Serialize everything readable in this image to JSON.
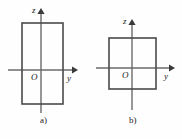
{
  "figure": {
    "background_color": "#fefefe",
    "line_color": "#555555",
    "box_color": "#4a4a4a",
    "text_color": "#1a1a1a",
    "panels": [
      {
        "id": "a",
        "caption": "a)",
        "origin_label": "O",
        "vertical_axis_label": "z",
        "horizontal_axis_label": "y",
        "shape": "tall-rectangle",
        "rect": {
          "x": 22,
          "y": 23,
          "width": 41,
          "height": 81
        },
        "origin": {
          "x": 41,
          "y": 70
        },
        "vertical_axis": {
          "x": 41,
          "y_top": 10,
          "y_bottom": 113
        },
        "horizontal_axis": {
          "y": 70,
          "x_left": 8,
          "x_right": 75
        }
      },
      {
        "id": "b",
        "caption": "b)",
        "origin_label": "O",
        "vertical_axis_label": "z",
        "horizontal_axis_label": "y",
        "shape": "square",
        "rect": {
          "x": 18,
          "y": 38,
          "width": 47,
          "height": 51
        },
        "origin": {
          "x": 41,
          "y": 68
        },
        "vertical_axis": {
          "x": 41,
          "y_top": 20,
          "y_bottom": 110
        },
        "horizontal_axis": {
          "y": 68,
          "x_left": 5,
          "x_right": 81
        }
      }
    ]
  }
}
